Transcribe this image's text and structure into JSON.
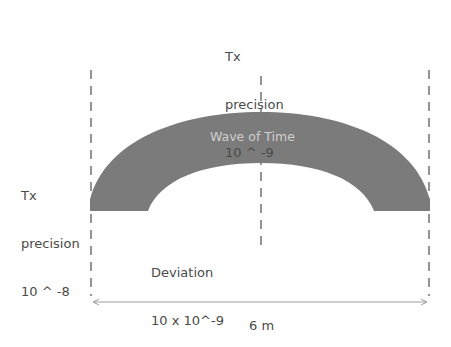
{
  "diagram": {
    "arch": {
      "title": "Wave of Time",
      "fill_color": "#7b7b7b",
      "title_color": "#cfcfcf"
    },
    "labels": {
      "top": {
        "line1": "Tx",
        "line2": "precision",
        "line3": "10 ^ -9"
      },
      "left": {
        "line1": "Tx",
        "line2": "precision",
        "line3": "10 ^ -8"
      },
      "deviation": {
        "line1": "Deviation",
        "line2": "10 x 10^-9"
      }
    },
    "dimension": {
      "label": "6 m"
    },
    "colors": {
      "dashed_line": "#7a7a7a",
      "text": "#4a4a4a",
      "dimension_line": "#9a9a9a"
    }
  }
}
